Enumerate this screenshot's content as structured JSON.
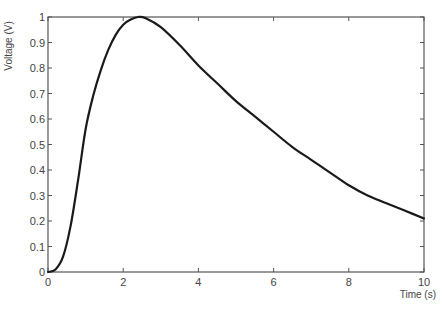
{
  "chart_data": {
    "type": "line",
    "title": "",
    "xlabel": "Time (s)",
    "ylabel": "Voltage (V)",
    "xlim": [
      0,
      10
    ],
    "ylim": [
      0,
      1
    ],
    "grid": false,
    "legend": null,
    "x_ticks": [
      0,
      2,
      4,
      6,
      8,
      10
    ],
    "x_tick_labels": [
      "0",
      "2",
      "4",
      "6",
      "8",
      "10"
    ],
    "y_ticks": [
      0,
      0.1,
      0.2,
      0.3,
      0.4,
      0.5,
      0.6,
      0.7,
      0.8,
      0.9,
      1
    ],
    "y_tick_labels": [
      "0",
      "0.1",
      "0.2",
      "0.3",
      "0.4",
      "0.5",
      "0.6",
      "0.7",
      "0.8",
      "0.9",
      "1"
    ],
    "series": [
      {
        "name": "Voltage",
        "color": "#1a1a1a",
        "x": [
          0,
          0.2,
          0.4,
          0.6,
          0.8,
          1.0,
          1.2,
          1.4,
          1.6,
          1.8,
          2.0,
          2.2,
          2.4,
          2.6,
          3.0,
          3.5,
          4.0,
          4.5,
          5.0,
          5.5,
          6.0,
          6.5,
          7.0,
          7.5,
          8.0,
          8.5,
          9.0,
          9.5,
          10.0
        ],
        "values": [
          0,
          0.01,
          0.06,
          0.18,
          0.36,
          0.56,
          0.69,
          0.79,
          0.87,
          0.93,
          0.97,
          0.99,
          1.0,
          0.995,
          0.96,
          0.89,
          0.81,
          0.74,
          0.67,
          0.61,
          0.55,
          0.49,
          0.44,
          0.39,
          0.34,
          0.3,
          0.27,
          0.24,
          0.21
        ]
      }
    ]
  }
}
